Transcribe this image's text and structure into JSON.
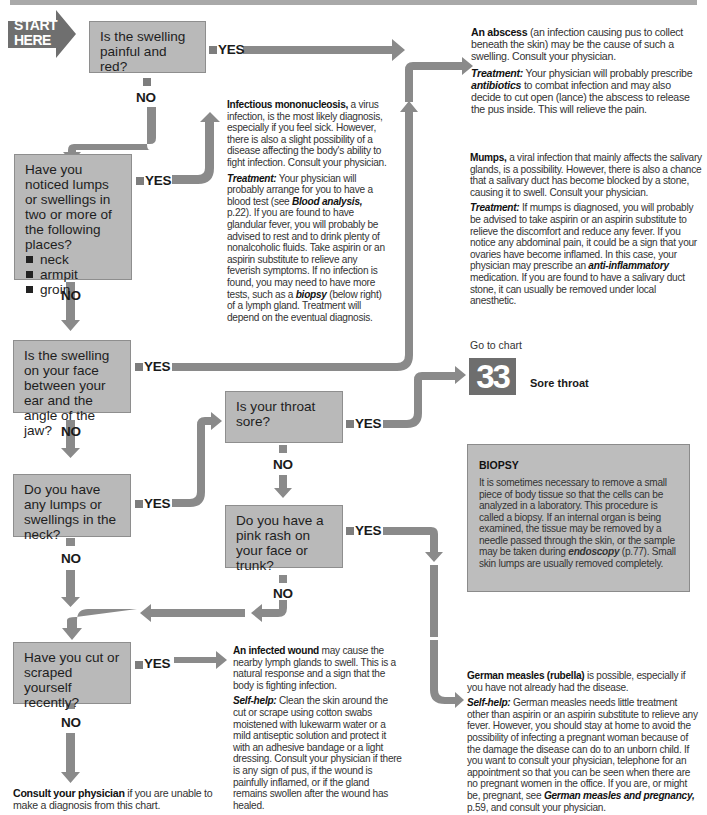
{
  "start_label": [
    "START",
    "HERE"
  ],
  "branch_labels": {
    "yes": "YES",
    "no": "NO"
  },
  "questions": [
    {
      "id": "q1",
      "text": "Is the swelling painful and red?"
    },
    {
      "id": "q2",
      "text": "Have you noticed lumps or swellings in two or more of the following places?",
      "bullets": [
        "neck",
        "armpit",
        "groin"
      ]
    },
    {
      "id": "q3",
      "text": "Is the swelling on your face between your ear and the angle of the jaw?"
    },
    {
      "id": "q4",
      "text": "Is your throat sore?"
    },
    {
      "id": "q5",
      "text": "Do you have any lumps or swellings in the neck?"
    },
    {
      "id": "q6",
      "text": "Do you have a pink rash on your face or trunk?"
    },
    {
      "id": "q7",
      "text": "Have you cut or scraped yourself recently?"
    }
  ],
  "outcomes": {
    "abscess": {
      "title": "An abscess",
      "body": " (an infection causing pus to collect beneath the skin) may be the cause of such a swelling. Consult your physician.",
      "treatment_label": "Treatment:",
      "treatment_pre": " Your physician will probably prescribe ",
      "treatment_em": "antibiotics",
      "treatment_post": " to combat infection and may also decide to cut open (lance) the abscess to release the pus inside. This will relieve the pain."
    },
    "mononucleosis": {
      "title": "Infectious mononucleosis,",
      "body": " a virus infection, is the most likely diagnosis, especially if you feel sick. However, there is also a slight possibility of a disease affecting the body's ability to fight infection. Consult your physician.",
      "treatment_label": "Treatment:",
      "treatment_pre": " Your physician will probably arrange for you to have a blood test (see ",
      "treatment_em": "Blood analysis,",
      "treatment_mid": " p.22). If you are found to have glandular fever, you will probably be advised to rest and to drink plenty of nonalcoholic fluids. Take aspirin or an aspirin substitute to relieve any feverish symptoms. If no infection is found, you may need to have more tests, such as a ",
      "treatment_em2": "biopsy",
      "treatment_post": " (below right) of a lymph gland. Treatment will depend on the eventual diagnosis."
    },
    "mumps": {
      "title": "Mumps,",
      "body": " a viral infection that mainly affects the salivary glands, is a possibility. However, there is also a chance that a salivary duct has become blocked by a stone, causing it to swell. Consult your physician.",
      "treatment_label": "Treatment:",
      "treatment_pre": " If mumps is diagnosed, you will probably be advised to take aspirin or an aspirin substitute to relieve the discomfort and reduce any fever. If you notice any abdominal pain, it could be a sign that your ovaries have become inflamed. In this case, your physician may prescribe an ",
      "treatment_em": "anti-inflammatory",
      "treatment_post": " medication. If you are found to have a salivary duct stone, it can usually be removed under local anesthetic."
    },
    "sore_throat": {
      "goto": "Go to chart",
      "chart_number": "33",
      "chart_title": "Sore throat"
    },
    "infected_wound": {
      "title": "An infected wound",
      "body": " may cause the nearby lymph glands to swell. This is a natural response and a sign that the body is fighting infection.",
      "selfhelp_label": "Self-help:",
      "selfhelp": " Clean the skin around the cut or scrape using cotton swabs moistened with lukewarm water or a mild antiseptic solution and protect it with an adhesive bandage or a light dressing. Consult your physician if there is any sign of pus, if the wound is painfully inflamed, or if the gland remains swollen after the wound has healed."
    },
    "german_measles": {
      "title": "German measles (rubella)",
      "body": " is possible, especially if you have not already had the disease.",
      "selfhelp_label": "Self-help:",
      "selfhelp_pre": " German measles needs little treatment other than aspirin or an aspirin substitute to relieve any fever. However, you should stay at home to avoid the possibility of infecting a pregnant woman because of the damage the disease can do to an unborn child. If you want to consult your physician, telephone for an appointment so that you can be seen when there are no pregnant women in the office. If you are, or might be, pregnant, see ",
      "selfhelp_em": "German measles and pregnancy,",
      "selfhelp_post": " p.59, and consult your physician."
    },
    "consult": {
      "title": "Consult your physician",
      "body": " if you are unable to make a diagnosis from this chart."
    }
  },
  "biopsy_box": {
    "heading": "BIOPSY",
    "text_pre": "It is sometimes necessary to remove a small piece of body tissue so that the cells can be analyzed in a laboratory. This procedure is called a biopsy. If an internal organ is being examined, the tissue may be removed by a needle passed through the skin, or the sample may be taken during ",
    "text_em": "endoscopy",
    "text_post": " (p.77). Small skin lumps are usually removed completely."
  },
  "colors": {
    "box_fill": "#b9b9b9",
    "arrow": "#8a8a8a",
    "start_arrow": "#6f6f6f",
    "chart_badge": "#6e6e6e"
  }
}
